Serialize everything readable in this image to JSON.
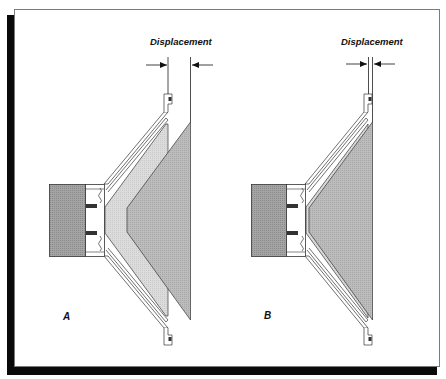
{
  "figure": {
    "panels": [
      {
        "id": "A",
        "label": "A",
        "displacement_label": "Displacement",
        "displacement": "large"
      },
      {
        "id": "B",
        "label": "B",
        "displacement_label": "Displacement",
        "displacement": "small"
      }
    ],
    "colors": {
      "magnet": "#9a9a9a",
      "cone_light": "#d6d6d6",
      "cone_dark": "#b0b0b0",
      "voice_coil": "#3a3a3a",
      "frame_border": "#7a7a7a",
      "shadow": "#0a0a0a",
      "line": "#222222"
    }
  }
}
